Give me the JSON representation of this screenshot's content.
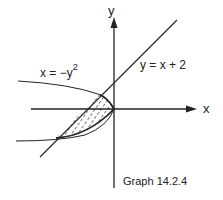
{
  "diagram": {
    "caption": "Graph 14.2.4",
    "axes": {
      "x_label": "x",
      "y_label": "y"
    },
    "curves": [
      {
        "name": "parabola",
        "equation_base": "x = −y",
        "equation_exponent": "2"
      },
      {
        "name": "line",
        "equation": "y = x + 2"
      }
    ],
    "shaded_region": "Region bounded by x = −y² and y = x + 2, between intersection points (−4, −2) and (−1, 1)",
    "colors": {
      "ink": "#222222",
      "background": "#ffffff"
    }
  }
}
